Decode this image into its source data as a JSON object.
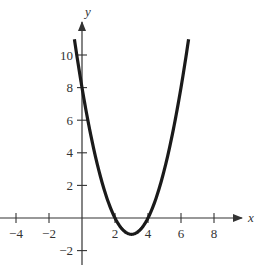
{
  "chart_data": {
    "type": "line",
    "title": "",
    "xlabel": "x",
    "ylabel": "y",
    "xlim": [
      -5,
      10
    ],
    "ylim": [
      -3,
      12
    ],
    "grid": false,
    "function": "y = x^2 - 6x + 8",
    "x_ticks": [
      -4,
      -2,
      2,
      4,
      6,
      8
    ],
    "x_tick_labels": [
      "−4",
      "−2",
      "2",
      "4",
      "6",
      "8"
    ],
    "y_ticks": [
      -2,
      2,
      4,
      6,
      8,
      10
    ],
    "y_tick_labels": [
      "−2",
      "2",
      "4",
      "6",
      "8",
      "10"
    ],
    "series": [
      {
        "name": "parabola",
        "domain": [
          -0.46,
          6.46
        ],
        "x": [
          -0.46,
          0,
          1,
          2,
          3,
          4,
          5,
          6,
          6.46
        ],
        "y": [
          11,
          8,
          3,
          0,
          -1,
          0,
          3,
          8,
          11
        ],
        "color": "#1a1a1a"
      }
    ]
  }
}
